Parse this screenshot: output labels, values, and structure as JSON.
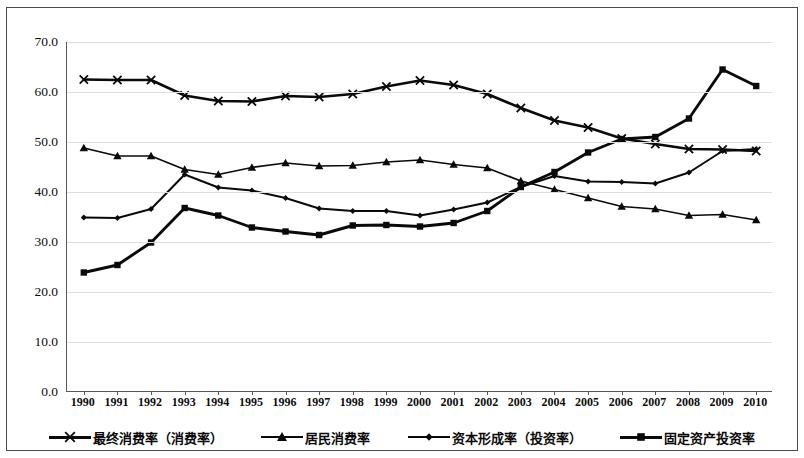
{
  "chart_data": {
    "type": "line",
    "title": "",
    "xlabel": "",
    "ylabel": "",
    "ylim": [
      0,
      70
    ],
    "yticks": [
      "0.0",
      "10.0",
      "20.0",
      "30.0",
      "40.0",
      "50.0",
      "60.0",
      "70.0"
    ],
    "grid": true,
    "legend_position": "bottom",
    "categories": [
      "1990",
      "1991",
      "1992",
      "1993",
      "1994",
      "1995",
      "1996",
      "1997",
      "1998",
      "1999",
      "2000",
      "2001",
      "2002",
      "2003",
      "2004",
      "2005",
      "2006",
      "2007",
      "2008",
      "2009",
      "2010"
    ],
    "series": [
      {
        "name": "最终消费率（消费率）",
        "marker": "x",
        "values": [
          62.5,
          62.4,
          62.4,
          59.3,
          58.2,
          58.1,
          59.2,
          59.0,
          59.6,
          61.1,
          62.3,
          61.4,
          59.6,
          56.8,
          54.3,
          52.9,
          50.7,
          49.6,
          48.6,
          48.5,
          48.2
        ]
      },
      {
        "name": "居民消费率",
        "marker": "triangle",
        "values": [
          48.8,
          47.2,
          47.2,
          44.5,
          43.5,
          44.9,
          45.8,
          45.2,
          45.3,
          46.0,
          46.4,
          45.5,
          44.8,
          42.2,
          40.5,
          38.8,
          37.1,
          36.6,
          35.3,
          35.5,
          34.4
        ]
      },
      {
        "name": "资本形成率（投资率）",
        "marker": "diamond",
        "values": [
          34.9,
          34.8,
          36.6,
          43.5,
          40.9,
          40.3,
          38.8,
          36.7,
          36.2,
          36.2,
          35.3,
          36.5,
          37.9,
          41.0,
          43.2,
          42.1,
          42.0,
          41.7,
          43.9,
          48.2,
          48.6
        ]
      },
      {
        "name": "固定资产投资率",
        "marker": "square",
        "values": [
          23.9,
          25.4,
          29.9,
          36.8,
          35.3,
          32.9,
          32.1,
          31.4,
          33.3,
          33.4,
          33.1,
          33.8,
          36.2,
          41.0,
          44.0,
          47.9,
          50.6,
          51.0,
          54.7,
          64.5,
          61.2
        ]
      }
    ],
    "colors": {
      "line": "#0a0a0a",
      "grid": "#dededd",
      "axis": "#55565a",
      "frame": "#4a4a4a",
      "background": "#ffffff"
    }
  },
  "legend": {
    "items": [
      {
        "label": "最终消费率（消费率）",
        "marker": "x"
      },
      {
        "label": "居民消费率",
        "marker": "triangle"
      },
      {
        "label": "资本形成率（投资率）",
        "marker": "diamond"
      },
      {
        "label": "固定资产投资率",
        "marker": "square"
      }
    ]
  }
}
